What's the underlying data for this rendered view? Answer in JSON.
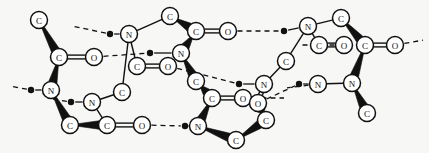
{
  "figure": {
    "kind": "molecular-structure-diagram",
    "background_color": "#f7f7f5",
    "stroke_color": "#111111",
    "atom_fill_color": "#ffffff",
    "hydrogen_dot_color": "#111111",
    "width": 429,
    "height": 153
  },
  "legend": {
    "atom_types": [
      "C",
      "N",
      "O"
    ],
    "bond_types": [
      "single",
      "double",
      "wedge",
      "hydrogen-bond"
    ]
  },
  "atoms": [
    {
      "id": "a1",
      "label": "C",
      "x": 39,
      "y": 20
    },
    {
      "id": "a2",
      "label": "C",
      "x": 59,
      "y": 57
    },
    {
      "id": "a3",
      "label": "O",
      "x": 94,
      "y": 57
    },
    {
      "id": "a4",
      "label": "N",
      "x": 51,
      "y": 90
    },
    {
      "id": "a5",
      "label": "C",
      "x": 70,
      "y": 125
    },
    {
      "id": "a6",
      "label": "N",
      "x": 92,
      "y": 102
    },
    {
      "id": "a7",
      "label": "C",
      "x": 107,
      "y": 125
    },
    {
      "id": "a8",
      "label": "O",
      "x": 142,
      "y": 125
    },
    {
      "id": "a9",
      "label": "C",
      "x": 122,
      "y": 92
    },
    {
      "id": "a10",
      "label": "N",
      "x": 129,
      "y": 34
    },
    {
      "id": "a11",
      "label": "C",
      "x": 170,
      "y": 16
    },
    {
      "id": "a12",
      "label": "C",
      "x": 137,
      "y": 66
    },
    {
      "id": "a13",
      "label": "O",
      "x": 168,
      "y": 66
    },
    {
      "id": "a14",
      "label": "C",
      "x": 196,
      "y": 31
    },
    {
      "id": "a15",
      "label": "O",
      "x": 228,
      "y": 31
    },
    {
      "id": "a16",
      "label": "N",
      "x": 181,
      "y": 53
    },
    {
      "id": "a17",
      "label": "C",
      "x": 196,
      "y": 81
    },
    {
      "id": "a18",
      "label": "C",
      "x": 212,
      "y": 98
    },
    {
      "id": "a19",
      "label": "O",
      "x": 243,
      "y": 98
    },
    {
      "id": "a20",
      "label": "N",
      "x": 198,
      "y": 126
    },
    {
      "id": "a21",
      "label": "C",
      "x": 236,
      "y": 140
    },
    {
      "id": "a22",
      "label": "C",
      "x": 266,
      "y": 120
    },
    {
      "id": "a23",
      "label": "N",
      "x": 264,
      "y": 84
    },
    {
      "id": "a24",
      "label": "O",
      "x": 258,
      "y": 103
    },
    {
      "id": "a25",
      "label": "C",
      "x": 286,
      "y": 61
    },
    {
      "id": "a26",
      "label": "N",
      "x": 308,
      "y": 26
    },
    {
      "id": "a27",
      "label": "C",
      "x": 341,
      "y": 18
    },
    {
      "id": "a28",
      "label": "C",
      "x": 319,
      "y": 45
    },
    {
      "id": "a29",
      "label": "O",
      "x": 344,
      "y": 45
    },
    {
      "id": "a30",
      "label": "C",
      "x": 365,
      "y": 45
    },
    {
      "id": "a31",
      "label": "O",
      "x": 395,
      "y": 45
    },
    {
      "id": "a32",
      "label": "N",
      "x": 352,
      "y": 83
    },
    {
      "id": "a33",
      "label": "C",
      "x": 367,
      "y": 113
    },
    {
      "id": "a34",
      "label": "N",
      "x": 318,
      "y": 84
    }
  ],
  "hydrogen_dots": [
    {
      "id": "h1",
      "x": 31,
      "y": 90
    },
    {
      "id": "h2",
      "x": 71,
      "y": 102
    },
    {
      "id": "h3",
      "x": 110,
      "y": 34
    },
    {
      "id": "h4",
      "x": 150,
      "y": 53
    },
    {
      "id": "h5",
      "x": 185,
      "y": 126
    },
    {
      "id": "h6",
      "x": 284,
      "y": 31
    },
    {
      "id": "h7",
      "x": 239,
      "y": 84
    },
    {
      "id": "h8",
      "x": 299,
      "y": 84
    }
  ],
  "bonds": [
    {
      "from": "a1",
      "to": "a2",
      "type": "wedge"
    },
    {
      "from": "a2",
      "to": "a3",
      "type": "double"
    },
    {
      "from": "a2",
      "to": "a4",
      "type": "wedge"
    },
    {
      "from": "a4",
      "to": "a5",
      "type": "wedge"
    },
    {
      "from": "a5",
      "to": "a7",
      "type": "wedge"
    },
    {
      "from": "a6",
      "to": "a7",
      "type": "single"
    },
    {
      "from": "a7",
      "to": "a8",
      "type": "double"
    },
    {
      "from": "a6",
      "to": "a9",
      "type": "single"
    },
    {
      "from": "a9",
      "to": "a10",
      "type": "single"
    },
    {
      "from": "a10",
      "to": "a11",
      "type": "single"
    },
    {
      "from": "a10",
      "to": "a12",
      "type": "single"
    },
    {
      "from": "a12",
      "to": "a13",
      "type": "double"
    },
    {
      "from": "a11",
      "to": "a14",
      "type": "wedge"
    },
    {
      "from": "a14",
      "to": "a15",
      "type": "double"
    },
    {
      "from": "a14",
      "to": "a16",
      "type": "wedge"
    },
    {
      "from": "a16",
      "to": "a17",
      "type": "wedge"
    },
    {
      "from": "a17",
      "to": "a18",
      "type": "wedge"
    },
    {
      "from": "a18",
      "to": "a19",
      "type": "double"
    },
    {
      "from": "a18",
      "to": "a20",
      "type": "wedge"
    },
    {
      "from": "a20",
      "to": "a21",
      "type": "wedge"
    },
    {
      "from": "a21",
      "to": "a22",
      "type": "wedge"
    },
    {
      "from": "a22",
      "to": "a24",
      "type": "wedge"
    },
    {
      "from": "a23",
      "to": "a24",
      "type": "double"
    },
    {
      "from": "a23",
      "to": "a25",
      "type": "single"
    },
    {
      "from": "a25",
      "to": "a26",
      "type": "single"
    },
    {
      "from": "a26",
      "to": "a27",
      "type": "single"
    },
    {
      "from": "a26",
      "to": "a28",
      "type": "single"
    },
    {
      "from": "a28",
      "to": "a29",
      "type": "double"
    },
    {
      "from": "a27",
      "to": "a30",
      "type": "wedge"
    },
    {
      "from": "a30",
      "to": "a31",
      "type": "double"
    },
    {
      "from": "a30",
      "to": "a32",
      "type": "wedge"
    },
    {
      "from": "a32",
      "to": "a33",
      "type": "wedge"
    },
    {
      "from": "a34",
      "to": "a32",
      "type": "single"
    }
  ],
  "hydrogen_bonds": [
    {
      "from": "h1",
      "to_x": 10,
      "to_y": 86,
      "type": "dashed"
    },
    {
      "from": "a4",
      "to": "h1",
      "type": "solid"
    },
    {
      "from": "h2",
      "to": "a6",
      "type": "solid"
    },
    {
      "from": "h2",
      "to_x": 52,
      "to_y": 99,
      "type": "dashed"
    },
    {
      "from": "h3",
      "to": "a10",
      "type": "solid"
    },
    {
      "from": "h3",
      "to_x": 72,
      "to_y": 26,
      "type": "dashed"
    },
    {
      "from": "a3",
      "to": "h4",
      "type": "dashed"
    },
    {
      "from": "h4",
      "to": "a16",
      "type": "solid"
    },
    {
      "from": "a8",
      "to": "h5",
      "type": "dashed"
    },
    {
      "from": "h5",
      "to": "a20",
      "type": "solid"
    },
    {
      "from": "a15",
      "to": "h6",
      "type": "dashed"
    },
    {
      "from": "h6",
      "to": "a26",
      "type": "solid"
    },
    {
      "from": "a13",
      "to": "h7",
      "type": "dashed"
    },
    {
      "from": "h7",
      "to": "a23",
      "type": "solid"
    },
    {
      "from": "a24",
      "to": "h8",
      "type": "dashed"
    },
    {
      "from": "h8",
      "to": "a34",
      "type": "solid"
    },
    {
      "from": "a19",
      "to_x": 285,
      "to_y": 98,
      "type": "dashed"
    },
    {
      "from": "a29",
      "to_x": 300,
      "to_y": 45,
      "type": "dashed"
    },
    {
      "from": "a31",
      "to_x": 424,
      "to_y": 40,
      "type": "dashed"
    },
    {
      "from": "a34",
      "to_x": 286,
      "to_y": 88,
      "type": "dashed"
    }
  ]
}
